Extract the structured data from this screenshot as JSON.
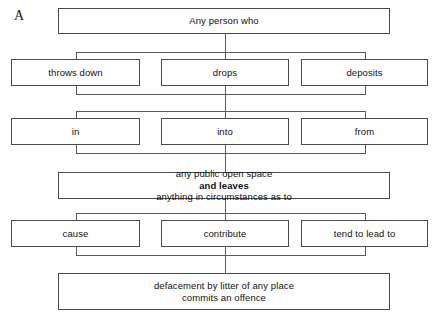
{
  "figure": {
    "label": "A",
    "type": "flowchart",
    "title_text": "Any person who"
  },
  "nodes": {
    "root": {
      "text": "Any person who"
    },
    "verbs": [
      {
        "text": "throws down"
      },
      {
        "text": "drops"
      },
      {
        "text": "deposits"
      }
    ],
    "prepositions": [
      {
        "text": "in"
      },
      {
        "text": "into"
      },
      {
        "text": "from"
      }
    ],
    "condition": {
      "prefix": "any public open space ",
      "emphasis": "and leaves",
      "suffix": " anything in circumstances as to"
    },
    "causation": [
      {
        "text": "cause"
      },
      {
        "text": "contribute"
      },
      {
        "text": "tend to lead to"
      }
    ],
    "outcome": {
      "line1": "defacement by litter of any place",
      "line2": "commits an offence"
    }
  },
  "colors": {
    "box_border": "#4a4a4a",
    "connector": "#5a5a5a",
    "background": "#ffffff",
    "text": "#111111"
  }
}
